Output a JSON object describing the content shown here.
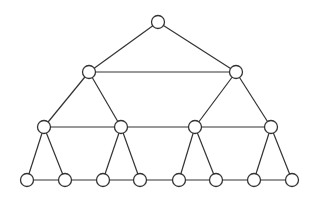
{
  "diagram": {
    "type": "tree-with-level-links",
    "colors": {
      "stroke": "#333333",
      "node_fill": "#ffffff",
      "background": "#ffffff"
    },
    "node_radius": 6.5,
    "nodes": [
      {
        "id": "n0",
        "level": 0,
        "x": 158,
        "y": 22
      },
      {
        "id": "n1",
        "level": 1,
        "x": 89,
        "y": 72
      },
      {
        "id": "n2",
        "level": 1,
        "x": 236,
        "y": 72
      },
      {
        "id": "n3",
        "level": 2,
        "x": 44,
        "y": 127
      },
      {
        "id": "n4",
        "level": 2,
        "x": 121,
        "y": 127
      },
      {
        "id": "n5",
        "level": 2,
        "x": 195,
        "y": 127
      },
      {
        "id": "n6",
        "level": 2,
        "x": 271,
        "y": 127
      },
      {
        "id": "n7",
        "level": 3,
        "x": 27,
        "y": 180
      },
      {
        "id": "n8",
        "level": 3,
        "x": 65,
        "y": 180
      },
      {
        "id": "n9",
        "level": 3,
        "x": 103,
        "y": 180
      },
      {
        "id": "n10",
        "level": 3,
        "x": 140,
        "y": 180
      },
      {
        "id": "n11",
        "level": 3,
        "x": 179,
        "y": 180
      },
      {
        "id": "n12",
        "level": 3,
        "x": 216,
        "y": 180
      },
      {
        "id": "n13",
        "level": 3,
        "x": 254,
        "y": 180
      },
      {
        "id": "n14",
        "level": 3,
        "x": 292,
        "y": 180
      }
    ],
    "edges": [
      [
        "n0",
        "n1"
      ],
      [
        "n0",
        "n2"
      ],
      [
        "n1",
        "n2"
      ],
      [
        "n1",
        "n3"
      ],
      [
        "n1",
        "n4"
      ],
      [
        "n2",
        "n5"
      ],
      [
        "n2",
        "n6"
      ],
      [
        "n3",
        "n4"
      ],
      [
        "n4",
        "n5"
      ],
      [
        "n5",
        "n6"
      ],
      [
        "n3",
        "n7"
      ],
      [
        "n3",
        "n8"
      ],
      [
        "n4",
        "n9"
      ],
      [
        "n4",
        "n10"
      ],
      [
        "n5",
        "n11"
      ],
      [
        "n5",
        "n12"
      ],
      [
        "n6",
        "n13"
      ],
      [
        "n6",
        "n14"
      ],
      [
        "n7",
        "n8"
      ],
      [
        "n8",
        "n9"
      ],
      [
        "n9",
        "n10"
      ],
      [
        "n10",
        "n11"
      ],
      [
        "n11",
        "n12"
      ],
      [
        "n12",
        "n13"
      ],
      [
        "n13",
        "n14"
      ]
    ]
  }
}
